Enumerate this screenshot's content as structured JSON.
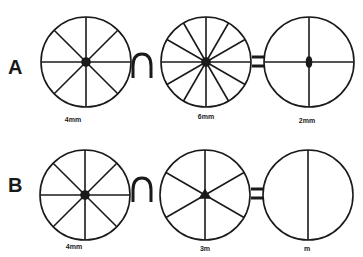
{
  "figure": {
    "rows": [
      {
        "label": "A",
        "operator_intersect": "∩",
        "operator_equals": "=",
        "circles": [
          {
            "caption": "4mm",
            "spokes": 8,
            "center_mark": "dot"
          },
          {
            "caption": "6mm",
            "spokes": 12,
            "center_mark": "dot"
          },
          {
            "caption": "2mm",
            "spokes": 4,
            "center_mark": "ellipse"
          }
        ]
      },
      {
        "label": "B",
        "operator_intersect": "∩",
        "operator_equals": "=",
        "circles": [
          {
            "caption": "4mm",
            "spokes": 8,
            "center_mark": "dot"
          },
          {
            "caption": "3m",
            "spokes": 6,
            "center_mark": "triangle"
          },
          {
            "caption": "m",
            "spokes": 2,
            "center_mark": "none"
          }
        ]
      }
    ],
    "colors": {
      "stroke": "#1a1a1a",
      "background": "#ffffff"
    }
  }
}
